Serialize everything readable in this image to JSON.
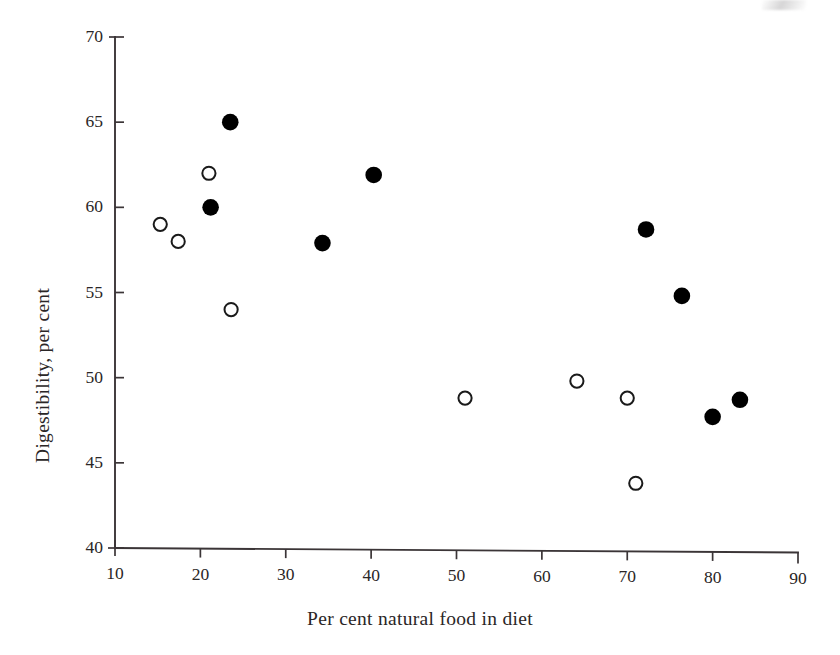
{
  "chart_data": {
    "type": "scatter",
    "title": "",
    "xlabel": "Per cent natural food in diet",
    "ylabel": "Digestibility, per cent",
    "xlim": [
      10,
      90
    ],
    "ylim": [
      40,
      70
    ],
    "xticks": [
      10,
      20,
      30,
      40,
      50,
      60,
      70,
      80,
      90
    ],
    "yticks": [
      40,
      45,
      50,
      55,
      60,
      65,
      70
    ],
    "xtick_labels": [
      "10",
      "20",
      "30",
      "40",
      "50",
      "60",
      "70",
      "80",
      "90"
    ],
    "ytick_labels": [
      "40",
      "45",
      "50",
      "55",
      "60",
      "65",
      "70"
    ],
    "grid": false,
    "legend": null,
    "axis_color": "#3b3537",
    "series": [
      {
        "name": "filled",
        "marker": "filled-circle",
        "color": "#000000",
        "points": [
          {
            "x": 23.5,
            "y": 65.0
          },
          {
            "x": 21.2,
            "y": 60.0
          },
          {
            "x": 34.3,
            "y": 57.9
          },
          {
            "x": 40.3,
            "y": 61.9
          },
          {
            "x": 72.2,
            "y": 58.7
          },
          {
            "x": 76.4,
            "y": 54.8
          },
          {
            "x": 80.0,
            "y": 47.7
          },
          {
            "x": 83.2,
            "y": 48.7
          }
        ]
      },
      {
        "name": "open",
        "marker": "open-circle",
        "color": "#1a1a1a",
        "points": [
          {
            "x": 15.3,
            "y": 59.0
          },
          {
            "x": 17.4,
            "y": 58.0
          },
          {
            "x": 21.0,
            "y": 62.0
          },
          {
            "x": 23.6,
            "y": 54.0
          },
          {
            "x": 51.0,
            "y": 48.8
          },
          {
            "x": 64.1,
            "y": 49.8
          },
          {
            "x": 70.0,
            "y": 48.8
          },
          {
            "x": 71.0,
            "y": 43.8
          }
        ]
      }
    ]
  }
}
